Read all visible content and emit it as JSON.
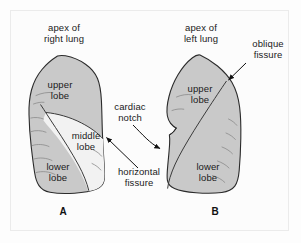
{
  "figure": {
    "background_color": "#fdfdfd",
    "frame_color": "#ebebeb"
  },
  "colors": {
    "lobe_shaded": "#c9c9c9",
    "lobe_light": "#f2f2f2",
    "outline": "#2b2b2b",
    "fissure_line": "#3a3a3a",
    "interior_hairline": "#8a8a8a",
    "text": "#1a1a1a",
    "arrow": "#111111"
  },
  "panels": [
    {
      "letter": "A",
      "organ": "right lung",
      "apex_label": "apex of\nright lung",
      "lobes": [
        {
          "name": "upper lobe",
          "label": "upper\nlobe",
          "fill": "shaded"
        },
        {
          "name": "middle lobe",
          "label": "middle\nlobe",
          "fill": "light"
        },
        {
          "name": "lower lobe",
          "label": "lower\nlobe",
          "fill": "shaded"
        }
      ],
      "fissures": [
        {
          "name": "horizontal fissure",
          "label": "horizontal\nfissure",
          "has_arrow": true
        },
        {
          "name": "oblique fissure",
          "label": "",
          "has_arrow": false
        }
      ]
    },
    {
      "letter": "B",
      "organ": "left lung",
      "apex_label": "apex of\nleft lung",
      "lobes": [
        {
          "name": "upper lobe",
          "label": "upper\nlobe",
          "fill": "shaded"
        },
        {
          "name": "lower lobe",
          "label": "lower\nlobe",
          "fill": "shaded"
        }
      ],
      "fissures": [
        {
          "name": "oblique fissure",
          "label": "oblique\nfissure",
          "has_arrow": true
        }
      ],
      "features": [
        {
          "name": "cardiac notch",
          "label": "cardiac\nnotch",
          "has_arrow": true
        }
      ]
    }
  ],
  "labels": {
    "apex_right": "apex of\nright lung",
    "apex_left": "apex of\nleft lung",
    "upper_lobe_right": "upper\nlobe",
    "middle_lobe_right": "middle\nlobe",
    "lower_lobe_right": "lower\nlobe",
    "upper_lobe_left": "upper\nlobe",
    "lower_lobe_left": "lower\nlobe",
    "horizontal_fissure": "horizontal\nfissure",
    "oblique_fissure": "oblique\nfissure",
    "cardiac_notch": "cardiac\nnotch",
    "panel_a": "A",
    "panel_b": "B"
  }
}
